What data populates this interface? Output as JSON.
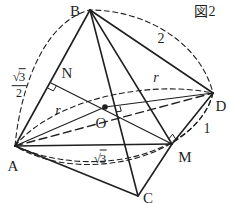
{
  "figure": {
    "title": "図2",
    "vertices": {
      "a": "A",
      "b": "B",
      "c": "C",
      "d": "D",
      "m": "M",
      "n": "N",
      "o": "O"
    },
    "lengths": {
      "bd": "2",
      "dm": "1",
      "am": {
        "radical": "√",
        "radicand": "3"
      },
      "an": {
        "radical": "√",
        "radicand": "3",
        "denominator": "2"
      },
      "radius_left": "r",
      "radius_right": "r"
    },
    "colors": {
      "line": "#1f1f1f",
      "background": "#ffffff"
    }
  }
}
